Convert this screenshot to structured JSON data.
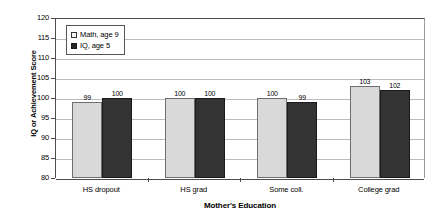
{
  "chart_data": {
    "type": "bar",
    "title": "",
    "xlabel": "Mother's Education",
    "ylabel": "IQ or Achievement Score",
    "categories": [
      "HS dropout",
      "HS grad",
      "Some coll.",
      "College grad"
    ],
    "series": [
      {
        "name": "Math, age 9",
        "values": [
          99,
          100,
          100,
          103
        ],
        "color": "#d9d9d9"
      },
      {
        "name": "IQ, age 5",
        "values": [
          100,
          100,
          99,
          102
        ],
        "color": "#333333"
      }
    ],
    "ylim": [
      80,
      120
    ],
    "ytick_step": 5,
    "yticks": [
      120,
      115,
      110,
      105,
      100,
      95,
      90,
      85,
      80
    ],
    "grid": true,
    "legend_position": "top-left",
    "show_data_labels": true
  }
}
